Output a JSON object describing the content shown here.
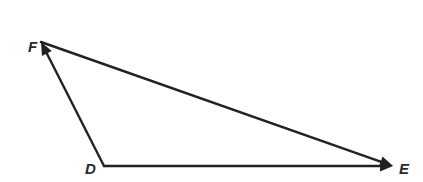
{
  "diagram": {
    "type": "triangle-vectors",
    "colors": {
      "stroke": "#222222",
      "label": "#2a2a2a",
      "background": "#ffffff"
    },
    "vertices": [
      {
        "id": "F",
        "label": "F",
        "x": 41,
        "y": 42,
        "label_x": 28,
        "label_y": 52
      },
      {
        "id": "D",
        "label": "D",
        "x": 104,
        "y": 166,
        "label_x": 85,
        "label_y": 174
      },
      {
        "id": "E",
        "label": "E",
        "x": 393,
        "y": 166,
        "label_x": 399,
        "label_y": 174
      }
    ],
    "edges": [
      {
        "id": "DF",
        "from": "D",
        "to": "F",
        "arrow_at": "F"
      },
      {
        "id": "DE",
        "from": "D",
        "to": "E",
        "arrow_at": "E"
      },
      {
        "id": "FE",
        "from": "F",
        "to": "E",
        "arrow_at": "E"
      }
    ]
  }
}
